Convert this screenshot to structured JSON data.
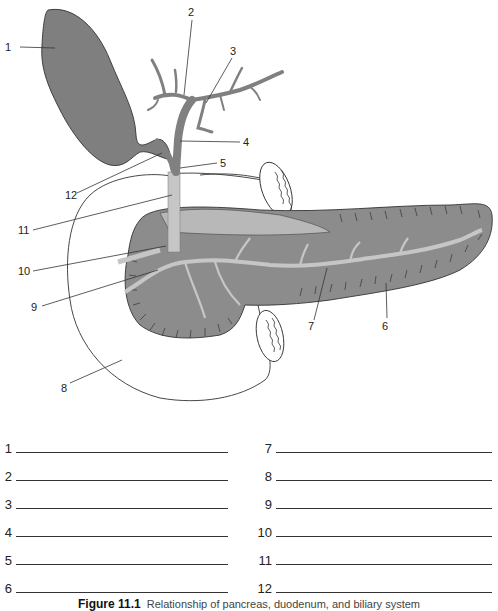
{
  "figure": {
    "title": "Figure 11.1",
    "caption": "Relationship of pancreas, duodenum, and biliary system",
    "colors": {
      "gallbladder": "#7f7f7f",
      "ducts_dark": "#808080",
      "ducts_light": "#c6c6c6",
      "pancreas": "#8c8c8c",
      "outline": "#333333"
    },
    "callouts": [
      {
        "n": "1",
        "x": 14,
        "y": 51
      },
      {
        "n": "2",
        "x": 190,
        "y": 17
      },
      {
        "n": "3",
        "x": 231,
        "y": 55
      },
      {
        "n": "4",
        "x": 244,
        "y": 146
      },
      {
        "n": "5",
        "x": 221,
        "y": 167
      },
      {
        "n": "6",
        "x": 385,
        "y": 329
      },
      {
        "n": "7",
        "x": 311,
        "y": 330
      },
      {
        "n": "8",
        "x": 62,
        "y": 390
      },
      {
        "n": "9",
        "x": 32,
        "y": 309
      },
      {
        "n": "10",
        "x": 20,
        "y": 274
      },
      {
        "n": "11",
        "x": 20,
        "y": 233
      },
      {
        "n": "12",
        "x": 65,
        "y": 197
      }
    ]
  },
  "worksheet": {
    "left_column": [
      {
        "number": "1",
        "answer": ""
      },
      {
        "number": "2",
        "answer": ""
      },
      {
        "number": "3",
        "answer": ""
      },
      {
        "number": "4",
        "answer": ""
      },
      {
        "number": "5",
        "answer": ""
      },
      {
        "number": "6",
        "answer": ""
      }
    ],
    "right_column": [
      {
        "number": "7",
        "answer": ""
      },
      {
        "number": "8",
        "answer": ""
      },
      {
        "number": "9",
        "answer": ""
      },
      {
        "number": "10",
        "answer": ""
      },
      {
        "number": "11",
        "answer": ""
      },
      {
        "number": "12",
        "answer": ""
      }
    ]
  }
}
